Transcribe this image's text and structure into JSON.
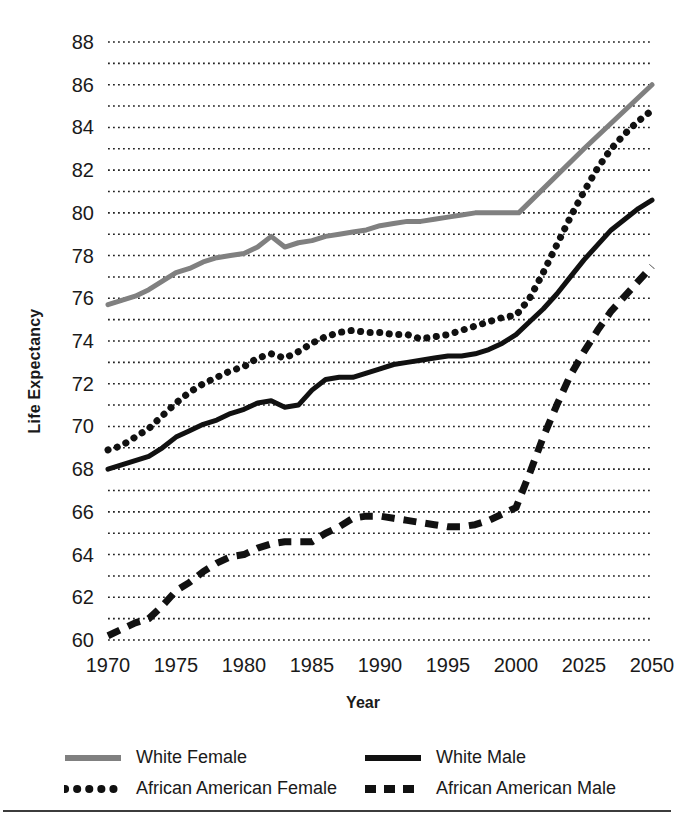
{
  "chart_data": {
    "type": "line",
    "title": "",
    "xlabel": "Year",
    "ylabel": "Life Expectancy",
    "ylim": [
      60,
      88
    ],
    "y_tick_step": 2,
    "y_gridline_step": 1,
    "grid": true,
    "grid_style": "dotted",
    "x_tick_labels": [
      "1970",
      "1975",
      "1980",
      "1985",
      "1990",
      "1995",
      "2000",
      "2025",
      "2050"
    ],
    "x_axis_note": "non-linear: equal spacing between 1970-2000 five-year steps, then 2025 and 2050",
    "y_tick_labels": [
      "60",
      "62",
      "64",
      "66",
      "68",
      "70",
      "72",
      "74",
      "76",
      "78",
      "80",
      "82",
      "84",
      "86",
      "88"
    ],
    "legend_position": "bottom",
    "series": [
      {
        "name": "White Female",
        "style": "solid",
        "color": "#808080",
        "x": [
          1970,
          1971,
          1972,
          1973,
          1974,
          1975,
          1976,
          1977,
          1978,
          1979,
          1980,
          1981,
          1982,
          1983,
          1984,
          1985,
          1986,
          1987,
          1988,
          1989,
          1990,
          1991,
          1992,
          1993,
          1994,
          1995,
          1996,
          1997,
          1998,
          1999,
          2000,
          2001,
          2025,
          2050
        ],
        "values": [
          75.7,
          75.9,
          76.1,
          76.4,
          76.8,
          77.2,
          77.4,
          77.7,
          77.9,
          78.0,
          78.1,
          78.4,
          78.9,
          78.4,
          78.6,
          78.7,
          78.9,
          79.0,
          79.1,
          79.2,
          79.4,
          79.5,
          79.6,
          79.6,
          79.7,
          79.8,
          79.9,
          80.0,
          80.0,
          80.0,
          80.0,
          80.0,
          83.0,
          86.0
        ]
      },
      {
        "name": "White Male",
        "style": "solid",
        "color": "#111111",
        "x": [
          1970,
          1971,
          1972,
          1973,
          1974,
          1975,
          1976,
          1977,
          1978,
          1979,
          1980,
          1981,
          1982,
          1983,
          1984,
          1985,
          1986,
          1987,
          1988,
          1989,
          1990,
          1991,
          1992,
          1993,
          1994,
          1995,
          1996,
          1997,
          1998,
          1999,
          2000,
          2005,
          2010,
          2015,
          2020,
          2025,
          2030,
          2035,
          2040,
          2045,
          2050
        ],
        "values": [
          68.0,
          68.2,
          68.4,
          68.6,
          69.0,
          69.5,
          69.8,
          70.1,
          70.3,
          70.6,
          70.8,
          71.1,
          71.2,
          70.9,
          71.0,
          71.7,
          72.2,
          72.3,
          72.3,
          72.5,
          72.7,
          72.9,
          73.0,
          73.1,
          73.2,
          73.3,
          73.3,
          73.4,
          73.6,
          73.9,
          74.3,
          74.9,
          75.5,
          76.2,
          77.0,
          77.8,
          78.5,
          79.2,
          79.7,
          80.2,
          80.6
        ]
      },
      {
        "name": "African American Female",
        "style": "dotted",
        "color": "#111111",
        "x": [
          1970,
          1971,
          1972,
          1973,
          1974,
          1975,
          1976,
          1977,
          1978,
          1979,
          1980,
          1981,
          1982,
          1983,
          1984,
          1985,
          1986,
          1987,
          1988,
          1989,
          1990,
          1991,
          1992,
          1993,
          1994,
          1995,
          1996,
          1997,
          1998,
          1999,
          2000,
          2005,
          2010,
          2015,
          2020,
          2025,
          2030,
          2035,
          2040,
          2045,
          2050
        ],
        "values": [
          68.9,
          69.1,
          69.5,
          69.9,
          70.5,
          71.1,
          71.6,
          72.0,
          72.3,
          72.6,
          72.8,
          73.2,
          73.4,
          73.2,
          73.5,
          73.9,
          74.2,
          74.4,
          74.5,
          74.4,
          74.4,
          74.3,
          74.3,
          74.1,
          74.2,
          74.3,
          74.5,
          74.7,
          74.9,
          75.1,
          75.2,
          76.0,
          77.2,
          78.5,
          79.8,
          81.0,
          82.1,
          83.0,
          83.7,
          84.3,
          84.8
        ]
      },
      {
        "name": "African American Male",
        "style": "dashed",
        "color": "#111111",
        "x": [
          1970,
          1971,
          1972,
          1973,
          1974,
          1975,
          1976,
          1977,
          1978,
          1979,
          1980,
          1981,
          1982,
          1983,
          1984,
          1985,
          1986,
          1987,
          1988,
          1989,
          1990,
          1991,
          1992,
          1993,
          1994,
          1995,
          1996,
          1997,
          1998,
          1999,
          2000,
          2005,
          2010,
          2015,
          2020,
          2025,
          2030,
          2035,
          2040,
          2045,
          2050
        ],
        "values": [
          60.2,
          60.5,
          60.8,
          61.0,
          61.6,
          62.3,
          62.7,
          63.2,
          63.6,
          63.9,
          64.0,
          64.3,
          64.5,
          64.6,
          64.6,
          64.6,
          65.0,
          65.3,
          65.7,
          65.8,
          65.8,
          65.7,
          65.6,
          65.5,
          65.4,
          65.3,
          65.3,
          65.4,
          65.6,
          65.9,
          66.2,
          67.8,
          69.5,
          71.0,
          72.4,
          73.5,
          74.5,
          75.4,
          76.1,
          76.8,
          77.5
        ]
      }
    ]
  },
  "legend": {
    "items": [
      {
        "label": "White Female",
        "style": "solid",
        "color": "#808080"
      },
      {
        "label": "White Male",
        "style": "solid",
        "color": "#111111"
      },
      {
        "label": "African American Female",
        "style": "dotted",
        "color": "#111111"
      },
      {
        "label": "African American Male",
        "style": "dashed",
        "color": "#111111"
      }
    ]
  }
}
